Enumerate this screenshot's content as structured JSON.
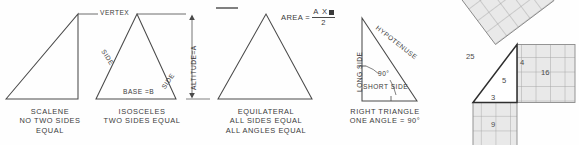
{
  "figure": {
    "ink_color": "#3a3a3a",
    "grid_color": "#9a9a9a",
    "fill_color": "#e8e8e8"
  },
  "panels": {
    "scalene": {
      "caption_line1": "SCALENE",
      "caption_line2": "NO TWO SIDES",
      "caption_line3": "EQUAL"
    },
    "isosceles": {
      "caption_line1": "ISOSCELES",
      "caption_line2": "TWO SIDES EQUAL",
      "side_left": "SIDE",
      "side_right": "SIDE",
      "base": "BASE =B"
    },
    "equilateral": {
      "caption_line1": "EQUILATERAL",
      "caption_line2": "ALL SIDES EQUAL",
      "caption_line3": "ALL ANGLES EQUAL"
    },
    "right": {
      "caption_line1": "RIGHT TRIANGLE",
      "caption_line2": "ONE ANGLE = 90°",
      "long_side": "LONG SIDE",
      "short_side": "SHORT SIDE",
      "hypotenuse": "HYPOTENUSE",
      "angle": "90°"
    },
    "pythagoras": {
      "square_hyp": "25",
      "square_vert": "16",
      "square_horiz": "9",
      "leg_short": "3",
      "leg_long": "4",
      "hyp": "5",
      "grid_hyp": 5,
      "grid_vert": 4,
      "grid_horiz": 3
    }
  },
  "annotations": {
    "vertex": "VERTEX",
    "altitude": "ALTITUDE=A",
    "area_label": "AREA =",
    "area_numerator": "A X",
    "area_denominator": "2"
  }
}
